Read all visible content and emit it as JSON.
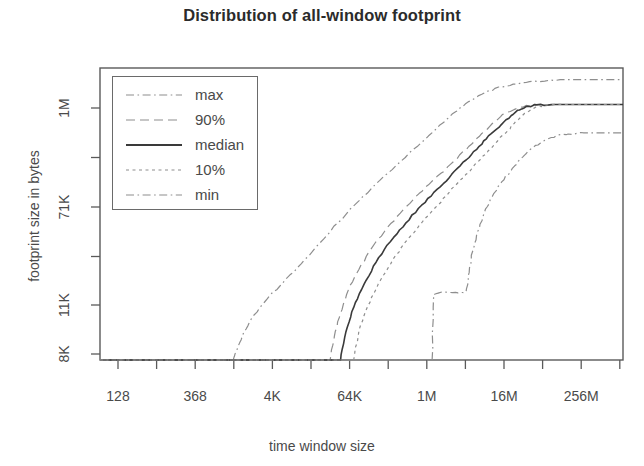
{
  "chart_data": {
    "type": "line",
    "title": "Distribution of all-window footprint",
    "xlabel": "time window size",
    "ylabel": "footprint size in bytes",
    "grid": false,
    "legend_position": "top-left inside plot",
    "x_tick_labels": [
      "128",
      "368",
      "4K",
      "64K",
      "1M",
      "16M",
      "256M"
    ],
    "x_tick_labels_all": [
      "128",
      "",
      "368",
      "",
      "4K",
      "",
      "64K",
      "",
      "1M",
      "",
      "16M",
      "",
      "256M",
      ""
    ],
    "y_tick_labels": [
      "8K",
      "11K",
      "71K",
      "1M"
    ],
    "y_tick_labels_all": [
      "1M",
      "",
      "71K",
      "",
      "11K",
      "8K"
    ],
    "xlim_labels": [
      "128",
      "256M"
    ],
    "ylim_labels": [
      "8K",
      "1M"
    ],
    "series": [
      {
        "name": "max",
        "style": "dashdot",
        "points": [
          [
            0.0,
            1.0
          ],
          [
            0.255,
            1.0
          ],
          [
            0.262,
            0.965
          ],
          [
            0.275,
            0.905
          ],
          [
            0.295,
            0.845
          ],
          [
            0.32,
            0.79
          ],
          [
            0.35,
            0.735
          ],
          [
            0.385,
            0.67
          ],
          [
            0.42,
            0.6
          ],
          [
            0.455,
            0.53
          ],
          [
            0.495,
            0.455
          ],
          [
            0.535,
            0.385
          ],
          [
            0.575,
            0.32
          ],
          [
            0.615,
            0.255
          ],
          [
            0.65,
            0.195
          ],
          [
            0.68,
            0.15
          ],
          [
            0.705,
            0.115
          ],
          [
            0.73,
            0.09
          ],
          [
            0.755,
            0.07
          ],
          [
            0.79,
            0.055
          ],
          [
            0.83,
            0.045
          ],
          [
            0.88,
            0.04
          ],
          [
            1.0,
            0.04
          ]
        ]
      },
      {
        "name": "90%",
        "style": "dashed",
        "points": [
          [
            0.0,
            1.0
          ],
          [
            0.44,
            1.0
          ],
          [
            0.448,
            0.92
          ],
          [
            0.46,
            0.84
          ],
          [
            0.475,
            0.76
          ],
          [
            0.495,
            0.69
          ],
          [
            0.52,
            0.615
          ],
          [
            0.55,
            0.545
          ],
          [
            0.58,
            0.485
          ],
          [
            0.61,
            0.43
          ],
          [
            0.64,
            0.38
          ],
          [
            0.67,
            0.33
          ],
          [
            0.7,
            0.28
          ],
          [
            0.725,
            0.235
          ],
          [
            0.75,
            0.19
          ],
          [
            0.775,
            0.155
          ],
          [
            0.8,
            0.135
          ],
          [
            0.825,
            0.127
          ],
          [
            0.86,
            0.125
          ],
          [
            1.0,
            0.125
          ]
        ]
      },
      {
        "name": "median",
        "style": "solid",
        "points": [
          [
            0.0,
            1.0
          ],
          [
            0.46,
            1.0
          ],
          [
            0.47,
            0.905
          ],
          [
            0.485,
            0.82
          ],
          [
            0.505,
            0.74
          ],
          [
            0.528,
            0.665
          ],
          [
            0.555,
            0.595
          ],
          [
            0.585,
            0.53
          ],
          [
            0.615,
            0.47
          ],
          [
            0.645,
            0.415
          ],
          [
            0.672,
            0.365
          ],
          [
            0.7,
            0.315
          ],
          [
            0.725,
            0.268
          ],
          [
            0.748,
            0.225
          ],
          [
            0.772,
            0.185
          ],
          [
            0.795,
            0.15
          ],
          [
            0.815,
            0.132
          ],
          [
            0.835,
            0.126
          ],
          [
            0.87,
            0.125
          ],
          [
            1.0,
            0.125
          ]
        ]
      },
      {
        "name": "10%",
        "style": "dotted",
        "points": [
          [
            0.0,
            1.0
          ],
          [
            0.485,
            1.0
          ],
          [
            0.495,
            0.9
          ],
          [
            0.512,
            0.815
          ],
          [
            0.532,
            0.74
          ],
          [
            0.556,
            0.67
          ],
          [
            0.582,
            0.6
          ],
          [
            0.61,
            0.54
          ],
          [
            0.64,
            0.48
          ],
          [
            0.668,
            0.425
          ],
          [
            0.695,
            0.375
          ],
          [
            0.722,
            0.322
          ],
          [
            0.748,
            0.275
          ],
          [
            0.77,
            0.23
          ],
          [
            0.792,
            0.19
          ],
          [
            0.812,
            0.155
          ],
          [
            0.832,
            0.135
          ],
          [
            0.852,
            0.127
          ],
          [
            0.885,
            0.125
          ],
          [
            1.0,
            0.125
          ]
        ]
      },
      {
        "name": "min",
        "style": "dashdot",
        "points": [
          [
            0.0,
            1.0
          ],
          [
            0.635,
            1.0
          ],
          [
            0.638,
            0.775
          ],
          [
            0.648,
            0.77
          ],
          [
            0.68,
            0.768
          ],
          [
            0.7,
            0.766
          ],
          [
            0.706,
            0.7
          ],
          [
            0.712,
            0.63
          ],
          [
            0.722,
            0.56
          ],
          [
            0.735,
            0.495
          ],
          [
            0.75,
            0.44
          ],
          [
            0.768,
            0.39
          ],
          [
            0.788,
            0.345
          ],
          [
            0.808,
            0.305
          ],
          [
            0.828,
            0.272
          ],
          [
            0.85,
            0.248
          ],
          [
            0.872,
            0.232
          ],
          [
            0.895,
            0.226
          ],
          [
            0.925,
            0.222
          ],
          [
            1.0,
            0.222
          ]
        ]
      }
    ]
  },
  "legend": {
    "items": [
      {
        "label": "max",
        "style": "dashdot"
      },
      {
        "label": "90%",
        "style": "dashed"
      },
      {
        "label": "median",
        "style": "solid"
      },
      {
        "label": "10%",
        "style": "dotted"
      },
      {
        "label": "min",
        "style": "dashdot"
      }
    ]
  },
  "colors": {
    "axis": "#5a5a5a",
    "text": "#4a4a4a",
    "title": "#2b2b2b",
    "median_line": "#3a3a3a",
    "other_line": "#8e8e8e",
    "background": "#ffffff"
  }
}
